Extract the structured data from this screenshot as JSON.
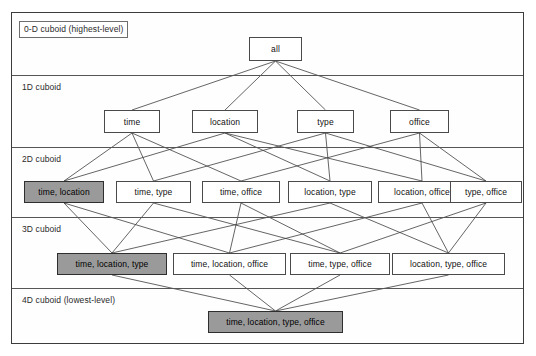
{
  "diagram": {
    "frame": {
      "x": 11,
      "y": 12,
      "width": 513,
      "height": 332
    },
    "colors": {
      "shaded_fill": "#9a9a9a",
      "plain_fill": "#ffffff",
      "border": "#4a4a4a",
      "band_line": "#555555"
    },
    "levels": [
      {
        "id": "level-0d",
        "label": "0-D cuboid (highest-level)",
        "boxed": true,
        "label_x": 19,
        "label_y": 21
      },
      {
        "id": "level-1d",
        "label": "1D cuboid",
        "boxed": false,
        "label_x": 22,
        "label_y": 82
      },
      {
        "id": "level-2d",
        "label": "2D cuboid",
        "boxed": false,
        "label_x": 22,
        "label_y": 154
      },
      {
        "id": "level-3d",
        "label": "3D cuboid",
        "boxed": false,
        "label_x": 22,
        "label_y": 224
      },
      {
        "id": "level-4d",
        "label": "4D cuboid (lowest-level)",
        "boxed": false,
        "label_x": 22,
        "label_y": 295
      }
    ],
    "band_lines_y": [
      75,
      147,
      217,
      288
    ],
    "nodes": [
      {
        "id": "all",
        "label": "all",
        "x": 249,
        "y": 37,
        "w": 53,
        "h": 24,
        "shaded": false,
        "level": 0
      },
      {
        "id": "time",
        "label": "time",
        "x": 104,
        "y": 110,
        "w": 56,
        "h": 23,
        "shaded": false,
        "level": 1
      },
      {
        "id": "location",
        "label": "location",
        "x": 192,
        "y": 110,
        "w": 66,
        "h": 23,
        "shaded": false,
        "level": 1
      },
      {
        "id": "type",
        "label": "type",
        "x": 297,
        "y": 110,
        "w": 57,
        "h": 23,
        "shaded": false,
        "level": 1
      },
      {
        "id": "office",
        "label": "office",
        "x": 390,
        "y": 110,
        "w": 59,
        "h": 23,
        "shaded": false,
        "level": 1
      },
      {
        "id": "time-location",
        "label": "time, location",
        "x": 24,
        "y": 181,
        "w": 80,
        "h": 22,
        "shaded": true,
        "level": 2
      },
      {
        "id": "time-type",
        "label": "time, type",
        "x": 116,
        "y": 181,
        "w": 75,
        "h": 22,
        "shaded": false,
        "level": 2
      },
      {
        "id": "time-office",
        "label": "time, office",
        "x": 202,
        "y": 181,
        "w": 78,
        "h": 22,
        "shaded": false,
        "level": 2
      },
      {
        "id": "location-type",
        "label": "location, type",
        "x": 288,
        "y": 181,
        "w": 84,
        "h": 22,
        "shaded": false,
        "level": 2
      },
      {
        "id": "location-office",
        "label": "location, office",
        "x": 378,
        "y": 181,
        "w": 88,
        "h": 22,
        "shaded": false,
        "level": 2
      },
      {
        "id": "type-office",
        "label": "type, office",
        "x": 450,
        "y": 181,
        "w": 72,
        "h": 22,
        "shaded": false,
        "level": 2
      },
      {
        "id": "time-location-type",
        "label": "time, location, type",
        "x": 57,
        "y": 253,
        "w": 110,
        "h": 22,
        "shaded": true,
        "level": 3
      },
      {
        "id": "time-location-office",
        "label": "time, location, office",
        "x": 173,
        "y": 253,
        "w": 113,
        "h": 22,
        "shaded": false,
        "level": 3
      },
      {
        "id": "time-type-office",
        "label": "time, type, office",
        "x": 290,
        "y": 253,
        "w": 100,
        "h": 22,
        "shaded": false,
        "level": 3
      },
      {
        "id": "location-type-office",
        "label": "location, type, office",
        "x": 392,
        "y": 253,
        "w": 113,
        "h": 22,
        "shaded": false,
        "level": 3
      },
      {
        "id": "time-location-type-office",
        "label": "time, location, type, office",
        "x": 208,
        "y": 311,
        "w": 135,
        "h": 22,
        "shaded": true,
        "level": 4
      }
    ],
    "edges": [
      {
        "from": "all",
        "to": "time"
      },
      {
        "from": "all",
        "to": "location"
      },
      {
        "from": "all",
        "to": "type"
      },
      {
        "from": "all",
        "to": "office"
      },
      {
        "from": "time",
        "to": "time-location"
      },
      {
        "from": "time",
        "to": "time-type"
      },
      {
        "from": "time",
        "to": "time-office"
      },
      {
        "from": "location",
        "to": "time-location"
      },
      {
        "from": "location",
        "to": "location-type"
      },
      {
        "from": "location",
        "to": "location-office"
      },
      {
        "from": "type",
        "to": "time-type"
      },
      {
        "from": "type",
        "to": "location-type"
      },
      {
        "from": "type",
        "to": "type-office"
      },
      {
        "from": "office",
        "to": "time-office"
      },
      {
        "from": "office",
        "to": "location-office"
      },
      {
        "from": "office",
        "to": "type-office"
      },
      {
        "from": "time-location",
        "to": "time-location-type"
      },
      {
        "from": "time-location",
        "to": "time-location-office"
      },
      {
        "from": "time-type",
        "to": "time-location-type"
      },
      {
        "from": "time-type",
        "to": "time-type-office"
      },
      {
        "from": "time-office",
        "to": "time-location-office"
      },
      {
        "from": "time-office",
        "to": "time-type-office"
      },
      {
        "from": "location-type",
        "to": "time-location-type"
      },
      {
        "from": "location-type",
        "to": "location-type-office"
      },
      {
        "from": "location-office",
        "to": "time-location-office"
      },
      {
        "from": "location-office",
        "to": "location-type-office"
      },
      {
        "from": "type-office",
        "to": "time-type-office"
      },
      {
        "from": "type-office",
        "to": "location-type-office"
      },
      {
        "from": "time-location-type",
        "to": "time-location-type-office"
      },
      {
        "from": "time-location-office",
        "to": "time-location-type-office"
      },
      {
        "from": "time-type-office",
        "to": "time-location-type-office"
      },
      {
        "from": "location-type-office",
        "to": "time-location-type-office"
      }
    ]
  }
}
